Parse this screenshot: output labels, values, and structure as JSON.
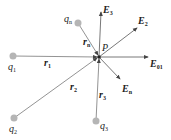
{
  "diagram": {
    "title": "",
    "point": {
      "label": "P",
      "x": 99,
      "y": 57
    },
    "charges": [
      {
        "id": "q1",
        "base": "q",
        "sub": "1",
        "x": 13,
        "y": 56,
        "lx": 8,
        "ly": 62
      },
      {
        "id": "q2",
        "base": "q",
        "sub": "2",
        "x": 14,
        "y": 118,
        "lx": 9,
        "ly": 125
      },
      {
        "id": "q3",
        "base": "q",
        "sub": "3",
        "x": 96,
        "y": 121,
        "lx": 100,
        "ly": 121
      },
      {
        "id": "qn",
        "base": "q",
        "sub": "n",
        "x": 78,
        "y": 23,
        "lx": 64,
        "ly": 14
      }
    ],
    "position_vectors": [
      {
        "base": "r",
        "sub": "1",
        "lx": 44,
        "ly": 58
      },
      {
        "base": "r",
        "sub": "2",
        "lx": 70,
        "ly": 82
      },
      {
        "base": "r",
        "sub": "3",
        "lx": 99,
        "ly": 91
      },
      {
        "base": "r",
        "sub": "n",
        "lx": 84,
        "ly": 38
      }
    ],
    "field_vectors": [
      {
        "base": "E",
        "sub": "01",
        "x2": 148,
        "y2": 57,
        "lx": 150,
        "ly": 59
      },
      {
        "base": "E",
        "sub": "2",
        "x2": 137,
        "y2": 28,
        "lx": 138,
        "ly": 17
      },
      {
        "base": "E",
        "sub": "3",
        "x2": 101,
        "y2": 12,
        "lx": 104,
        "ly": 6
      },
      {
        "base": "E",
        "sub": "n",
        "x2": 120,
        "y2": 79,
        "lx": 122,
        "ly": 84
      }
    ],
    "colors": {
      "line": "#6a6a6a",
      "charge": "#b5b5b5",
      "text": "#222222"
    }
  }
}
